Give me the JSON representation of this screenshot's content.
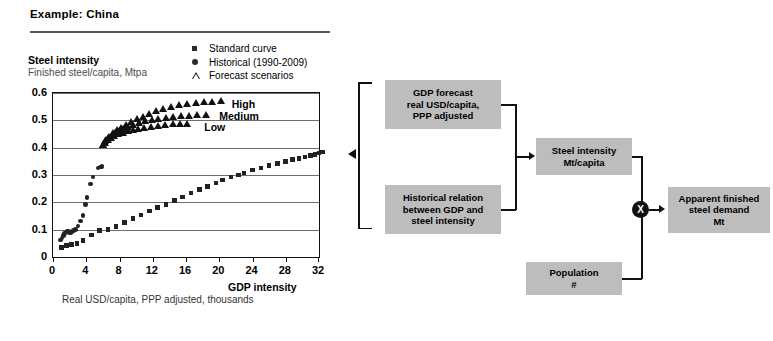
{
  "header": {
    "title": "Example: China"
  },
  "chart_data": {
    "type": "scatter",
    "title": "Steel intensity",
    "subtitle": "Finished steel/capita, Mtpa",
    "xlabel": "GDP intensity",
    "xlabel_sub": "Real USD/capita, PPP adjusted, thousands",
    "ylabel": "",
    "xlim": [
      0,
      32
    ],
    "ylim": [
      0,
      0.6
    ],
    "xticks": [
      0,
      4,
      8,
      12,
      16,
      20,
      24,
      28,
      32
    ],
    "yticks": [
      "0",
      "0.1",
      "0.2",
      "0.3",
      "0.4",
      "0.5",
      "0.6"
    ],
    "ytick_values": [
      0,
      0.1,
      0.2,
      0.3,
      0.4,
      0.5,
      0.6
    ],
    "grid": "horizontal",
    "legend_position": "top-right-outside",
    "legend": [
      {
        "label": "Standard curve",
        "marker": "square"
      },
      {
        "label": "Historical (1990-2009)",
        "marker": "circle"
      },
      {
        "label": "Forecast scenarios",
        "marker": "triangle-open"
      }
    ],
    "annotations": [
      {
        "text": "High",
        "x": 21.5,
        "y": 0.555
      },
      {
        "text": "Medium",
        "x": 20.0,
        "y": 0.512
      },
      {
        "text": "Low",
        "x": 18.2,
        "y": 0.472
      }
    ],
    "series": [
      {
        "name": "Standard curve",
        "marker": "square",
        "points": [
          [
            1.0,
            0.035
          ],
          [
            1.6,
            0.042
          ],
          [
            2.2,
            0.046
          ],
          [
            2.9,
            0.049
          ],
          [
            3.6,
            0.06
          ],
          [
            4.6,
            0.08
          ],
          [
            5.6,
            0.098
          ],
          [
            6.6,
            0.1
          ],
          [
            7.6,
            0.112
          ],
          [
            8.6,
            0.126
          ],
          [
            9.6,
            0.14
          ],
          [
            10.6,
            0.154
          ],
          [
            11.6,
            0.168
          ],
          [
            12.6,
            0.181
          ],
          [
            13.6,
            0.193
          ],
          [
            14.6,
            0.206
          ],
          [
            15.6,
            0.22
          ],
          [
            16.6,
            0.234
          ],
          [
            17.6,
            0.246
          ],
          [
            18.6,
            0.258
          ],
          [
            19.6,
            0.27
          ],
          [
            20.4,
            0.281
          ],
          [
            21.4,
            0.292
          ],
          [
            22.3,
            0.3
          ],
          [
            23.0,
            0.308
          ],
          [
            24.0,
            0.318
          ],
          [
            25.0,
            0.326
          ],
          [
            26.0,
            0.334
          ],
          [
            27.0,
            0.342
          ],
          [
            28.0,
            0.35
          ],
          [
            28.8,
            0.356
          ],
          [
            29.6,
            0.361
          ],
          [
            30.3,
            0.366
          ],
          [
            31.0,
            0.371
          ],
          [
            31.5,
            0.376
          ],
          [
            32.0,
            0.381
          ],
          [
            32.4,
            0.384
          ]
        ]
      },
      {
        "name": "Historical (1990-2009)",
        "marker": "circle",
        "points": [
          [
            0.9,
            0.062
          ],
          [
            1.1,
            0.07
          ],
          [
            1.25,
            0.078
          ],
          [
            1.4,
            0.085
          ],
          [
            1.55,
            0.092
          ],
          [
            1.7,
            0.095
          ],
          [
            1.85,
            0.093
          ],
          [
            2.0,
            0.09
          ],
          [
            2.15,
            0.088
          ],
          [
            2.3,
            0.091
          ],
          [
            2.5,
            0.096
          ],
          [
            2.7,
            0.1
          ],
          [
            3.0,
            0.114
          ],
          [
            3.3,
            0.132
          ],
          [
            3.6,
            0.152
          ],
          [
            3.9,
            0.192
          ],
          [
            4.1,
            0.217
          ],
          [
            4.5,
            0.267
          ],
          [
            4.8,
            0.292
          ],
          [
            5.4,
            0.325
          ],
          [
            5.7,
            0.33
          ],
          [
            5.9,
            0.332
          ]
        ]
      },
      {
        "name": "Forecast scenarios - High",
        "marker": "triangle",
        "points": [
          [
            6.0,
            0.4
          ],
          [
            6.4,
            0.418
          ],
          [
            6.8,
            0.432
          ],
          [
            7.2,
            0.444
          ],
          [
            7.7,
            0.455
          ],
          [
            8.2,
            0.464
          ],
          [
            8.8,
            0.475
          ],
          [
            9.4,
            0.485
          ],
          [
            10.1,
            0.496
          ],
          [
            10.8,
            0.505
          ],
          [
            11.6,
            0.515
          ],
          [
            12.4,
            0.524
          ],
          [
            13.3,
            0.532
          ],
          [
            14.2,
            0.54
          ],
          [
            15.2,
            0.546
          ],
          [
            16.2,
            0.552
          ],
          [
            17.2,
            0.556
          ],
          [
            18.2,
            0.558
          ],
          [
            19.2,
            0.56
          ],
          [
            20.2,
            0.561
          ]
        ]
      },
      {
        "name": "Forecast scenarios - Medium",
        "marker": "triangle",
        "points": [
          [
            6.0,
            0.4
          ],
          [
            6.3,
            0.414
          ],
          [
            6.7,
            0.426
          ],
          [
            7.1,
            0.436
          ],
          [
            7.5,
            0.444
          ],
          [
            8.0,
            0.452
          ],
          [
            8.5,
            0.459
          ],
          [
            9.1,
            0.467
          ],
          [
            9.7,
            0.474
          ],
          [
            10.4,
            0.481
          ],
          [
            11.1,
            0.487
          ],
          [
            11.9,
            0.492
          ],
          [
            12.7,
            0.497
          ],
          [
            13.6,
            0.501
          ],
          [
            14.5,
            0.504
          ],
          [
            15.4,
            0.506
          ],
          [
            16.4,
            0.508
          ],
          [
            17.4,
            0.509
          ],
          [
            18.4,
            0.51
          ]
        ]
      },
      {
        "name": "Forecast scenarios - Low",
        "marker": "triangle",
        "points": [
          [
            6.0,
            0.4
          ],
          [
            6.3,
            0.41
          ],
          [
            6.6,
            0.419
          ],
          [
            7.0,
            0.427
          ],
          [
            7.4,
            0.434
          ],
          [
            7.9,
            0.44
          ],
          [
            8.4,
            0.446
          ],
          [
            9.0,
            0.451
          ],
          [
            9.6,
            0.456
          ],
          [
            10.3,
            0.46
          ],
          [
            11.0,
            0.464
          ],
          [
            11.8,
            0.468
          ],
          [
            12.6,
            0.471
          ],
          [
            13.5,
            0.474
          ],
          [
            14.4,
            0.476
          ],
          [
            15.3,
            0.478
          ],
          [
            16.2,
            0.479
          ]
        ]
      }
    ]
  },
  "flow": {
    "boxes": [
      {
        "id": "gdp-forecast",
        "lines": [
          "GDP forecast",
          "real USD/capita,",
          "PPP adjusted"
        ]
      },
      {
        "id": "historical-relation",
        "lines": [
          "Historical relation",
          "between GDP and",
          "steel intensity"
        ]
      },
      {
        "id": "steel-intensity",
        "lines": [
          "Steel intensity",
          "Mt/capita"
        ]
      },
      {
        "id": "population",
        "lines": [
          "Population",
          "#"
        ]
      },
      {
        "id": "apparent-demand",
        "lines": [
          "Apparent finished",
          "steel demand",
          "Mt"
        ]
      }
    ],
    "operator": "X"
  },
  "colors": {
    "box_fill": "#bdbdbd",
    "line": "#111111",
    "grid": "#6e6e6e",
    "subtitle": "#4c4c4c"
  }
}
